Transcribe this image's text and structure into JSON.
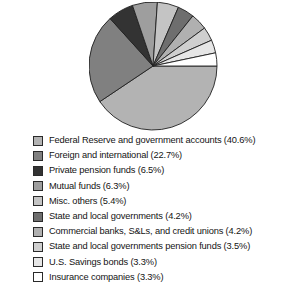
{
  "chart_data": {
    "type": "pie",
    "title": "",
    "start_angle_deg": 0,
    "direction": "clockwise",
    "legend_position": "bottom-left",
    "grid": false,
    "units": "percent",
    "categories": [
      "Federal Reserve and government accounts",
      "Foreign and international",
      "Private pension funds",
      "Mutual funds",
      "Misc. others",
      "State and local governments",
      "Commercial banks, S&Ls, and credit unions",
      "State and local governments pension funds",
      "U.S. Savings bonds",
      "Insurance companies"
    ],
    "values": [
      40.6,
      22.7,
      6.5,
      6.3,
      5.4,
      4.2,
      4.2,
      3.5,
      3.3,
      3.3
    ],
    "colors": [
      "#b3b3b3",
      "#808080",
      "#333333",
      "#9e9e9e",
      "#c4c4c4",
      "#6e6e6e",
      "#b0b0b0",
      "#cfcfcf",
      "#e6e6e6",
      "#ffffff"
    ],
    "slice_outline_color": "#1f1f1f"
  },
  "legend": {
    "items": [
      {
        "label": "Federal Reserve and government accounts (40.6%)",
        "color": "#b3b3b3",
        "name": "legend-item-federal-reserve"
      },
      {
        "label": "Foreign and international (22.7%)",
        "color": "#808080",
        "name": "legend-item-foreign-international"
      },
      {
        "label": "Private pension funds (6.5%)",
        "color": "#333333",
        "name": "legend-item-private-pension-funds"
      },
      {
        "label": "Mutual funds (6.3%)",
        "color": "#9e9e9e",
        "name": "legend-item-mutual-funds"
      },
      {
        "label": "Misc. others (5.4%)",
        "color": "#c4c4c4",
        "name": "legend-item-misc-others"
      },
      {
        "label": "State and local governments (4.2%)",
        "color": "#6e6e6e",
        "name": "legend-item-state-local-governments"
      },
      {
        "label": "Commercial banks, S&Ls, and credit unions (4.2%)",
        "color": "#b0b0b0",
        "name": "legend-item-commercial-banks"
      },
      {
        "label": "State and local governments pension funds (3.5%)",
        "color": "#cfcfcf",
        "name": "legend-item-state-local-pension-funds"
      },
      {
        "label": "U.S. Savings bonds (3.3%)",
        "color": "#e6e6e6",
        "name": "legend-item-us-savings-bonds"
      },
      {
        "label": "Insurance companies (3.3%)",
        "color": "#ffffff",
        "name": "legend-item-insurance-companies"
      }
    ]
  },
  "pie_geometry": {
    "center_x": 64,
    "center_y": 64,
    "radius": 64
  }
}
